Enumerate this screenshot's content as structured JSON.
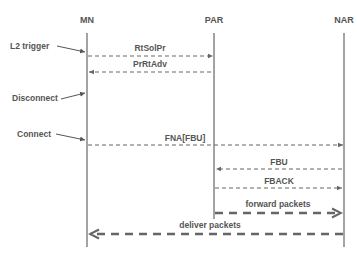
{
  "diagram": {
    "type": "sequence",
    "colors": {
      "line": "#666666",
      "text": "#555555",
      "background": "#ffffff"
    },
    "participants": [
      {
        "id": "MN",
        "label": "MN",
        "x": 87
      },
      {
        "id": "PAR",
        "label": "PAR",
        "x": 214
      },
      {
        "id": "NAR",
        "label": "NAR",
        "x": 344
      }
    ],
    "events": [
      {
        "label": "L2 trigger",
        "target": "MN"
      },
      {
        "label": "Disconnect",
        "target": "MN"
      },
      {
        "label": "Connect",
        "target": "MN"
      }
    ],
    "messages": [
      {
        "label": "RtSolPr",
        "from": "MN",
        "to": "PAR",
        "style": "dashed"
      },
      {
        "label": "PrRtAdv",
        "from": "PAR",
        "to": "MN",
        "style": "dashed"
      },
      {
        "label": "FNA[FBU]",
        "from": "MN",
        "to": "NAR",
        "style": "dashed"
      },
      {
        "label": "FBU",
        "from": "NAR",
        "to": "PAR",
        "style": "dashed"
      },
      {
        "label": "FBACK",
        "from": "PAR",
        "to": "NAR",
        "style": "dashed"
      },
      {
        "label": "forward packets",
        "from": "PAR",
        "to": "NAR",
        "style": "thick-dashed"
      },
      {
        "label": "deliver packets",
        "from": "NAR",
        "to": "MN",
        "style": "thick-dashed"
      }
    ]
  }
}
